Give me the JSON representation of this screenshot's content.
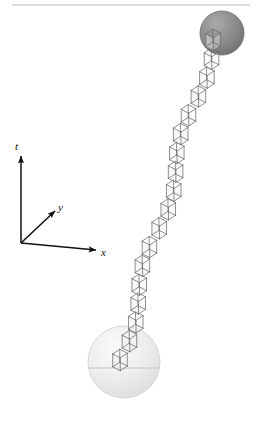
{
  "figure": {
    "width": 256,
    "height": 429,
    "background_color": "#ffffff"
  },
  "top_rule": {
    "name": "horizontal-rule",
    "x1": 12,
    "x2": 250,
    "y": 5,
    "color": "#b9b9b9",
    "thickness": 1.2
  },
  "axes": {
    "origin": {
      "x": 21,
      "y": 243
    },
    "color": "#111111",
    "items": [
      {
        "id": "t",
        "label": "t",
        "name": "axis-t",
        "tip": {
          "x": 21,
          "y": 156
        },
        "label_pos": {
          "x": 15,
          "y": 150
        }
      },
      {
        "id": "y",
        "label": "y",
        "name": "axis-y",
        "tip": {
          "x": 55,
          "y": 211
        },
        "label_pos": {
          "x": 58,
          "y": 211
        }
      },
      {
        "id": "x",
        "label": "x",
        "name": "axis-x",
        "tip": {
          "x": 96,
          "y": 250
        },
        "label_pos": {
          "x": 101,
          "y": 256
        }
      }
    ]
  },
  "spheres": [
    {
      "id": "emitter-sphere",
      "name": "light-sphere-bottom",
      "cx": 124,
      "cy": 362,
      "r": 36,
      "fill": "#e9e9e9",
      "edge": "#cfcfcf",
      "highlight": "#f6f6f6",
      "equator": true,
      "equator_y": 368,
      "equator_color": "#c2c2c2"
    },
    {
      "id": "absorber-sphere",
      "name": "dark-sphere-top",
      "cx": 222,
      "cy": 33,
      "r": 22,
      "fill": "#8d8d8d",
      "edge": "#6d6d6d",
      "highlight": "#a8a8a8",
      "equator": false,
      "equator_y": 0,
      "equator_color": "#6d6d6d"
    }
  ],
  "worldtube": {
    "name": "cube-chain-worldline",
    "description": "Chain of wireframe parallelepipeds forming a worldtube",
    "start": {
      "x": 120,
      "y": 360
    },
    "end": {
      "x": 213,
      "y": 40
    },
    "segments": 18,
    "cube_size": 13,
    "depth_dx": 9,
    "depth_dy": -6,
    "zigzag_amplitude": 5,
    "stroke": "#6b6b6b",
    "face_fill": "#f2f2f2",
    "face_opacity": 0.45,
    "stroke_width": 0.75
  },
  "colors": {
    "ink": "#111111",
    "rule": "#b9b9b9",
    "wire": "#6b6b6b",
    "sphere_light": "#e9e9e9",
    "sphere_dark": "#8d8d8d",
    "background": "#ffffff"
  }
}
